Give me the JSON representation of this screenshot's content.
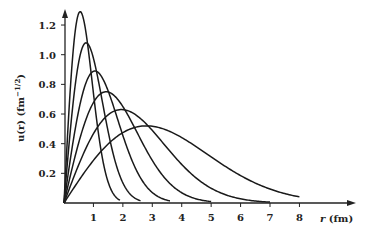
{
  "chart_data": {
    "type": "line",
    "title": "",
    "xlabel": "r (fm)",
    "ylabel": "u(r) (fm^-1/2)",
    "xlim": [
      0,
      9
    ],
    "ylim": [
      0,
      1.3
    ],
    "xticks": [
      1,
      2,
      3,
      4,
      5,
      6,
      7,
      8
    ],
    "xtick_labels": [
      "1",
      "2",
      "3",
      "4",
      "5",
      "6",
      "7",
      "8"
    ],
    "yticks": [
      0.2,
      0.4,
      0.6,
      0.8,
      1.0,
      1.2
    ],
    "ytick_labels": [
      "0.2",
      "0.4",
      "0.6",
      "0.8",
      "1.0",
      "1.2"
    ],
    "grid": false,
    "legend": null,
    "series": [
      {
        "name": "curve-1",
        "peak_r": 0.55,
        "peak_u": 1.29,
        "r_end": 1.9
      },
      {
        "name": "curve-2",
        "peak_r": 0.75,
        "peak_u": 1.08,
        "r_end": 2.6
      },
      {
        "name": "curve-3",
        "peak_r": 1.05,
        "peak_u": 0.89,
        "r_end": 3.6
      },
      {
        "name": "curve-4",
        "peak_r": 1.43,
        "peak_u": 0.75,
        "r_end": 5.0
      },
      {
        "name": "curve-5",
        "peak_r": 1.95,
        "peak_u": 0.63,
        "r_end": 7.0
      },
      {
        "name": "curve-6",
        "peak_r": 2.8,
        "peak_u": 0.52,
        "r_end": 8.0
      }
    ]
  },
  "labels": {
    "x_axis_var": "r",
    "x_axis_unit": " (fm)",
    "y_axis_text": "u(r) (fm",
    "y_axis_exp": "−1/2",
    "y_axis_close": ")"
  }
}
